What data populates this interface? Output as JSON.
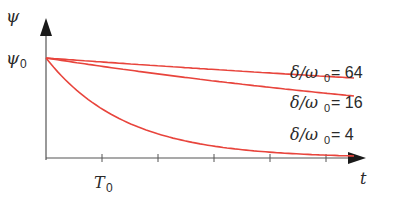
{
  "chart_data": {
    "type": "line",
    "title": "",
    "xlabel": "t",
    "ylabel": "ψ",
    "y_tick_label": "ψ0",
    "x_tick_label": "T0",
    "x_ticks_count": 5,
    "grid": false,
    "legend_position": "inline-right",
    "xlim": [
      0,
      5.7
    ],
    "ylim": [
      0,
      1
    ],
    "x_unit": "T0",
    "series": [
      {
        "name": "δ/ω0 = 64",
        "label_main": "δ/ω",
        "label_sub": "0",
        "label_tail": " = 64",
        "x": [
          0,
          1,
          2,
          3,
          4,
          5,
          5.5
        ],
        "values": [
          1.0,
          0.96,
          0.93,
          0.89,
          0.86,
          0.82,
          0.8
        ]
      },
      {
        "name": "δ/ω0 = 16",
        "label_main": "δ/ω",
        "label_sub": "0",
        "label_tail": " = 16",
        "x": [
          0,
          1,
          2,
          3,
          4,
          5,
          5.5
        ],
        "values": [
          1.0,
          0.92,
          0.84,
          0.77,
          0.71,
          0.65,
          0.62
        ]
      },
      {
        "name": "δ/ω0 = 4",
        "label_main": "δ/ω",
        "label_sub": "0",
        "label_tail": " = 4",
        "x": [
          0,
          1,
          2,
          3,
          4,
          5,
          5.5
        ],
        "values": [
          1.0,
          0.49,
          0.24,
          0.12,
          0.06,
          0.03,
          0.02
        ]
      }
    ],
    "line_color": "#e8443c",
    "axis_color": "#444444"
  }
}
